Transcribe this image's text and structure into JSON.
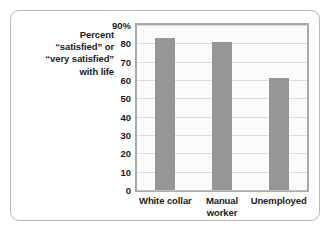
{
  "chart_data": {
    "type": "bar",
    "title": "",
    "subtitle": "",
    "xlabel": "",
    "ylabel": "Percent \"satisfied\" or \"very satisfied\" with life",
    "ylabel_lines": [
      "Percent",
      "“satisfied” or",
      "“very satisfied”",
      "with life"
    ],
    "categories": [
      "White collar",
      "Manual worker",
      "Unemployed"
    ],
    "category_label_lines": [
      [
        "White collar"
      ],
      [
        "Manual",
        "worker"
      ],
      [
        "Unemployed"
      ]
    ],
    "values": [
      83,
      81,
      61
    ],
    "ylim": [
      0,
      90
    ],
    "ytick_values": [
      90,
      80,
      70,
      60,
      50,
      40,
      30,
      20,
      10,
      0
    ],
    "ytick_labels": [
      "90%",
      "80",
      "70",
      "60",
      "50",
      "40",
      "30",
      "20",
      "10",
      "0"
    ],
    "grid": true,
    "grid_axis": "y",
    "legend": false,
    "legend_position": "none",
    "bar_color": "#969696",
    "plot_border_color": "#a9a9a9",
    "plot_background": "#fbfbfb",
    "gridline_color": "#dcdcdc",
    "figure_border_color": "#b8b8b8",
    "text_color": "#1b1b1b"
  }
}
